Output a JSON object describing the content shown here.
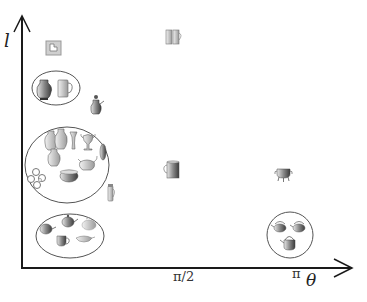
{
  "axes": {
    "y_label": "l",
    "x_label": "θ",
    "x_ticks": [
      {
        "label": "π/2",
        "value": "pi/2"
      },
      {
        "label": "π",
        "value": "pi"
      }
    ]
  },
  "groups": [
    {
      "name": "top-left-cluster",
      "items": [
        "amphora",
        "mug"
      ],
      "circled": true
    },
    {
      "name": "large-cluster",
      "items": [
        "amphora",
        "amphora",
        "tall-vase",
        "goblet",
        "vase",
        "jar",
        "bowl",
        "teapot",
        "flat-vessel",
        "rings"
      ],
      "circled": true
    },
    {
      "name": "teapots-cluster",
      "items": [
        "teapot",
        "teapot",
        "teapot",
        "cup",
        "gravy-boat"
      ],
      "circled": true
    },
    {
      "name": "kettles-cluster",
      "items": [
        "kettle",
        "kettle",
        "kettle"
      ],
      "circled": true
    }
  ],
  "singletons": [
    {
      "name": "square-icon",
      "position": "top-left"
    },
    {
      "name": "coffee-pot",
      "position": "left"
    },
    {
      "name": "double-cup",
      "position": "top-center"
    },
    {
      "name": "mug",
      "position": "center"
    },
    {
      "name": "thermos",
      "position": "left-lower"
    },
    {
      "name": "cauldron",
      "position": "right"
    }
  ],
  "colors": {
    "axis": "#1a1a1a",
    "ellipse": "#555555",
    "object_dark": "#555555",
    "object_light": "#bdbdbd"
  }
}
